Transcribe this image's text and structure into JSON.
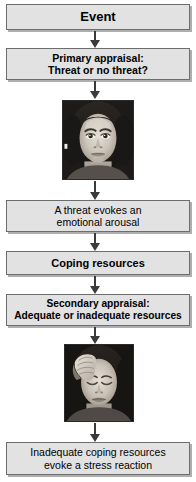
{
  "diagram": {
    "colors": {
      "box_fill": "#e2e2e2",
      "box_border": "#6d6d6d",
      "arrow": "#3a3a3a",
      "text": "#000000",
      "background": "#ffffff"
    },
    "nodes": [
      {
        "id": "event",
        "label": "Event",
        "weight": "bold",
        "font_size": "13px"
      },
      {
        "id": "primary-appraisal",
        "label": "Primary appraisal:\nThreat or no threat?",
        "weight": "bold",
        "font_size": "10.5px"
      },
      {
        "id": "threat-evokes-arousal",
        "label": "A threat evokes an\nemotional arousal",
        "weight": "normal",
        "font_size": "10.5px"
      },
      {
        "id": "coping-resources",
        "label": "Coping resources",
        "weight": "bold",
        "font_size": "11px"
      },
      {
        "id": "secondary-appraisal",
        "label": "Secondary appraisal:\nAdequate or inadequate resources",
        "weight": "bold",
        "font_size": "10.2px"
      },
      {
        "id": "stress-reaction",
        "label": "Inadequate coping resources\nevoke a stress reaction",
        "weight": "normal",
        "font_size": "10.5px"
      }
    ],
    "photos": [
      {
        "id": "photo-alert-face",
        "caption": "Black and white photograph of a woman's face with a neutral, alert expression looking forward"
      },
      {
        "id": "photo-stressed-face",
        "caption": "Black and white photograph of a woman with her hand on her forehead and eyes closed, appearing stressed"
      }
    ],
    "arrows": [
      {
        "id": "arrow-event-to-primary"
      },
      {
        "id": "arrow-primary-to-photo1"
      },
      {
        "id": "arrow-photo1-to-threat"
      },
      {
        "id": "arrow-threat-to-coping"
      },
      {
        "id": "arrow-coping-to-secondary"
      },
      {
        "id": "arrow-secondary-to-photo2"
      },
      {
        "id": "arrow-photo2-to-stress"
      }
    ]
  }
}
